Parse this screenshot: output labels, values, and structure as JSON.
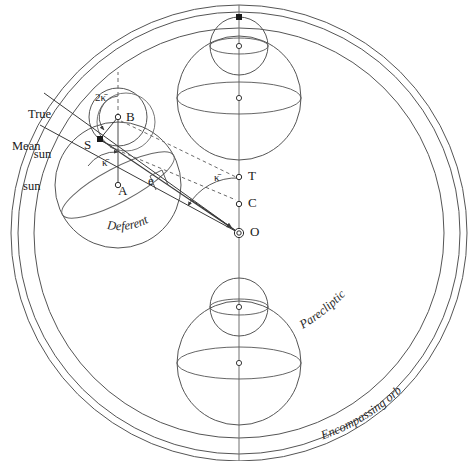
{
  "figure": {
    "background_color": "#ffffff",
    "line_color": "#4a4a4a",
    "text_color": "#1a1a1a",
    "dashed_color": "#6b6b6b"
  },
  "curved_labels": {
    "deferent": "Deferent",
    "parecliptic": "Parecliptic",
    "encompassing_orb": "Encompassing orb"
  },
  "point_labels": {
    "B": "B",
    "S": "S",
    "A": "A",
    "T": "T",
    "C": "C",
    "O": "O",
    "e": "e"
  },
  "angle_labels": {
    "two_kappa_bar": "2κ̄",
    "kappa_bar_epicycle": "κ̄",
    "kappa_bar_center": "κ̄"
  },
  "ray_labels": {
    "true_sun_line1": "True",
    "true_sun_line2": "sun",
    "mean_sun_line1": "Mean",
    "mean_sun_line2": "sun"
  },
  "geometry": {
    "center_O": [
      239,
      233
    ],
    "point_C": [
      239,
      204
    ],
    "point_T": [
      239,
      177
    ],
    "point_A": [
      118,
      185
    ],
    "point_B": [
      118,
      117
    ],
    "point_S": [
      100,
      139
    ],
    "outer_orb_radius_outer": 228,
    "outer_orb_radius_inner": 221,
    "parecliptic_radius": 205,
    "deferent_radius": 63,
    "epicycle_radius": 29,
    "small_circle_radius": 29
  }
}
